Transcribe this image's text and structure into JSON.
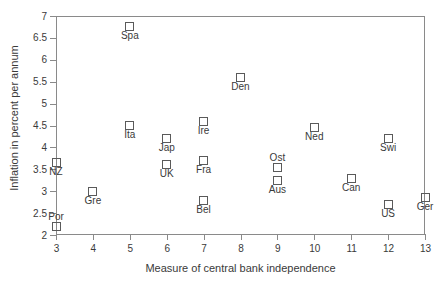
{
  "chart_data": {
    "type": "scatter",
    "title": "",
    "xlabel": "Measure of central bank independence",
    "ylabel": "Inflation in percent per annum",
    "xlim": [
      3,
      13
    ],
    "ylim": [
      2,
      7
    ],
    "xticks": [
      "3",
      "4",
      "5",
      "6",
      "7",
      "8",
      "9",
      "10",
      "11",
      "12",
      "13"
    ],
    "yticks": [
      "2",
      "2.5",
      "3",
      "3.5",
      "4",
      "4.5",
      "5",
      "5.5",
      "6",
      "6.5",
      "7"
    ],
    "grid": false,
    "legend": "none",
    "marker": "open-square",
    "marker_color": "#5a5a5a",
    "points": [
      {
        "label": "NZ",
        "x": 3,
        "y": 3.65,
        "label_pos": "below"
      },
      {
        "label": "Por",
        "x": 3,
        "y": 2.2,
        "label_pos": "above"
      },
      {
        "label": "Gre",
        "x": 4,
        "y": 3.0,
        "label_pos": "below"
      },
      {
        "label": "Spa",
        "x": 5,
        "y": 6.75,
        "label_pos": "below"
      },
      {
        "label": "Ita",
        "x": 5,
        "y": 4.5,
        "label_pos": "below"
      },
      {
        "label": "Jap",
        "x": 6,
        "y": 4.2,
        "label_pos": "below"
      },
      {
        "label": "UK",
        "x": 6,
        "y": 3.6,
        "label_pos": "below"
      },
      {
        "label": "Ire",
        "x": 7,
        "y": 4.6,
        "label_pos": "below"
      },
      {
        "label": "Fra",
        "x": 7,
        "y": 3.7,
        "label_pos": "below"
      },
      {
        "label": "Bel",
        "x": 7,
        "y": 2.78,
        "label_pos": "below"
      },
      {
        "label": "Den",
        "x": 8,
        "y": 5.6,
        "label_pos": "below"
      },
      {
        "label": "Ost",
        "x": 9,
        "y": 3.55,
        "label_pos": "above"
      },
      {
        "label": "Aus",
        "x": 9,
        "y": 3.25,
        "label_pos": "below"
      },
      {
        "label": "Ned",
        "x": 10,
        "y": 4.45,
        "label_pos": "below"
      },
      {
        "label": "Can",
        "x": 11,
        "y": 3.3,
        "label_pos": "below"
      },
      {
        "label": "Swi",
        "x": 12,
        "y": 4.2,
        "label_pos": "below"
      },
      {
        "label": "US",
        "x": 12,
        "y": 2.7,
        "label_pos": "below"
      },
      {
        "label": "Ger",
        "x": 13,
        "y": 2.85,
        "label_pos": "below"
      }
    ]
  }
}
